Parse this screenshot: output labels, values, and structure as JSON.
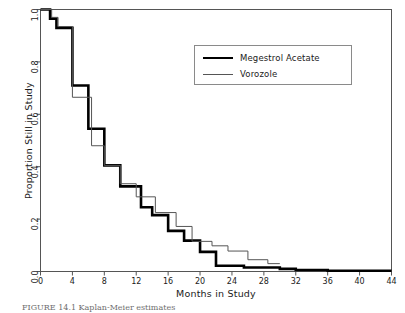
{
  "figure": {
    "caption": "FIGURE 14.1  Kaplan-Meier estimates",
    "background": "#ffffff",
    "frame_color": "#555555"
  },
  "axes": {
    "xlabel": "Months in Study",
    "ylabel": "Proportion Still in Study",
    "xticks": [
      "0",
      "4",
      "8",
      "12",
      "16",
      "20",
      "24",
      "28",
      "32",
      "36",
      "40",
      "44"
    ],
    "yticks": [
      "0.0",
      "0.2",
      "0.4",
      "0.6",
      "0.8",
      "1.0"
    ]
  },
  "legend": {
    "entries": [
      {
        "label": "Megestrol Acetate",
        "style": "thick",
        "color": "#000000"
      },
      {
        "label": "Vorozole",
        "style": "thin",
        "color": "#555555"
      }
    ]
  },
  "chart_data": {
    "type": "line",
    "subtype": "kaplan-meier-step",
    "title": "",
    "xlabel": "Months in Study",
    "ylabel": "Proportion Still in Study",
    "xlim": [
      0,
      44
    ],
    "ylim": [
      0,
      1
    ],
    "xtick_step": 4,
    "ytick_step": 0.2,
    "grid": false,
    "legend_position": "upper-right-inside",
    "series": [
      {
        "name": "Megestrol Acetate",
        "style": "thick",
        "color": "#000000",
        "linewidth": 2.6,
        "points": [
          [
            0,
            1.0
          ],
          [
            1.2,
            1.0
          ],
          [
            1.2,
            0.965
          ],
          [
            2.0,
            0.965
          ],
          [
            2.0,
            0.93
          ],
          [
            4.0,
            0.93
          ],
          [
            4.0,
            0.71
          ],
          [
            6.0,
            0.71
          ],
          [
            6.0,
            0.545
          ],
          [
            8.0,
            0.545
          ],
          [
            8.0,
            0.405
          ],
          [
            10.0,
            0.405
          ],
          [
            10.0,
            0.325
          ],
          [
            12.6,
            0.325
          ],
          [
            12.6,
            0.245
          ],
          [
            14.0,
            0.245
          ],
          [
            14.0,
            0.215
          ],
          [
            16.0,
            0.215
          ],
          [
            16.0,
            0.155
          ],
          [
            18.0,
            0.155
          ],
          [
            18.0,
            0.118
          ],
          [
            20.0,
            0.118
          ],
          [
            20.0,
            0.075
          ],
          [
            22.0,
            0.075
          ],
          [
            22.0,
            0.022
          ],
          [
            25.5,
            0.022
          ],
          [
            25.5,
            0.015
          ],
          [
            30.0,
            0.015
          ],
          [
            30.0,
            0.01
          ],
          [
            32.0,
            0.01
          ],
          [
            32.0,
            0.006
          ],
          [
            36.0,
            0.006
          ],
          [
            36.0,
            0.003
          ],
          [
            44.0,
            0.003
          ]
        ]
      },
      {
        "name": "Vorozole",
        "style": "thin",
        "color": "#555555",
        "linewidth": 1.0,
        "points": [
          [
            0,
            1.0
          ],
          [
            1.4,
            1.0
          ],
          [
            1.4,
            0.97
          ],
          [
            2.2,
            0.97
          ],
          [
            2.2,
            0.935
          ],
          [
            4.0,
            0.935
          ],
          [
            4.0,
            0.665
          ],
          [
            6.4,
            0.665
          ],
          [
            6.4,
            0.48
          ],
          [
            8.0,
            0.48
          ],
          [
            8.0,
            0.405
          ],
          [
            10.0,
            0.405
          ],
          [
            10.0,
            0.335
          ],
          [
            12.0,
            0.335
          ],
          [
            12.0,
            0.285
          ],
          [
            14.4,
            0.285
          ],
          [
            14.4,
            0.225
          ],
          [
            17.0,
            0.225
          ],
          [
            17.0,
            0.172
          ],
          [
            19.0,
            0.172
          ],
          [
            19.0,
            0.115
          ],
          [
            21.5,
            0.115
          ],
          [
            21.5,
            0.098
          ],
          [
            23.5,
            0.098
          ],
          [
            23.5,
            0.078
          ],
          [
            26.0,
            0.078
          ],
          [
            26.0,
            0.045
          ],
          [
            28.5,
            0.045
          ],
          [
            28.5,
            0.03
          ],
          [
            30.0,
            0.03
          ]
        ]
      }
    ],
    "notes": [
      "Curves nearly overlap from month 0 to month 12.",
      "Vorozole runs slightly below Megestrol Acetate between months 4 and 8.",
      "Vorozole rises above Megestrol Acetate after roughly month 13 and stays above through month 30.",
      "Megestrol Acetate flattens near zero after month 22 and extends to month 44.",
      "Vorozole curve terminates at about month 30."
    ]
  }
}
